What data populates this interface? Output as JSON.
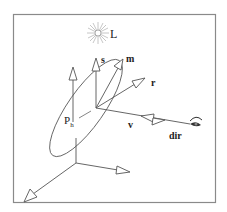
{
  "diagram": {
    "type": "vector-geometry",
    "labels": {
      "light": "L",
      "s": "s",
      "m": "m",
      "r": "r",
      "v": "v",
      "dir": "dir",
      "point_main": "P",
      "point_sub": "h"
    },
    "colors": {
      "stroke": "#555555",
      "frame": "#8a8a8a",
      "text": "#222222",
      "background": "#ffffff",
      "sun": "#b0b0b0"
    }
  }
}
